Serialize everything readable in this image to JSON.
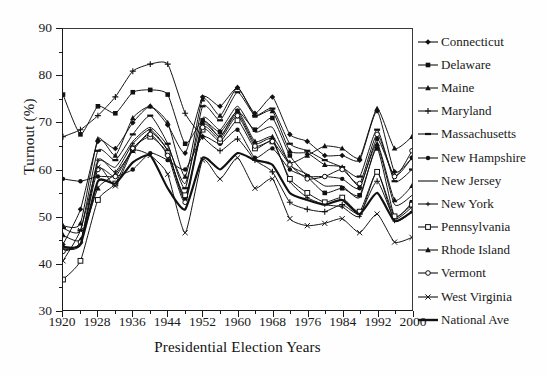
{
  "figure": {
    "background_color": "#fefefe",
    "ink_color": "#1a1a1a"
  },
  "chart_data": {
    "type": "line",
    "title": "",
    "subtitle": "",
    "xlabel": "Presidential Election Years",
    "ylabel": "Turnout (%)",
    "xlim": [
      1920,
      2000
    ],
    "ylim": [
      30,
      90
    ],
    "x": [
      1920,
      1924,
      1928,
      1932,
      1936,
      1940,
      1944,
      1948,
      1952,
      1956,
      1960,
      1964,
      1968,
      1972,
      1976,
      1980,
      1984,
      1988,
      1992,
      1996,
      2000
    ],
    "xticks": [
      1920,
      1928,
      1936,
      1944,
      1952,
      1960,
      1968,
      1976,
      1984,
      1992,
      2000
    ],
    "xtick_labels": [
      "1920",
      "1928",
      "1936",
      "1944",
      "1952",
      "1960",
      "1968",
      "1976",
      "1984",
      "1992",
      "2000"
    ],
    "xminor_ticks": [
      1924,
      1932,
      1940,
      1948,
      1956,
      1964,
      1972,
      1980,
      1988,
      1996
    ],
    "yticks": [
      30,
      40,
      50,
      60,
      70,
      80,
      90
    ],
    "ytick_labels": [
      "30",
      "40",
      "50",
      "60",
      "70",
      "80",
      "90"
    ],
    "yminor_ticks": [
      35,
      45,
      55,
      65,
      75,
      85
    ],
    "grid": false,
    "legend_position": "right",
    "series": [
      {
        "name": "Connecticut",
        "marker": "diamond",
        "line": "solid",
        "width": 1.0,
        "values": [
          44.0,
          51.5,
          66.0,
          64.5,
          70.0,
          73.5,
          69.5,
          63.5,
          75.5,
          73.5,
          77.5,
          72.0,
          75.5,
          67.5,
          66.0,
          63.0,
          63.0,
          62.0,
          72.5,
          59.5,
          62.5
        ]
      },
      {
        "name": "Delaware",
        "marker": "square",
        "line": "solid",
        "width": 1.0,
        "values": [
          76.0,
          67.5,
          73.5,
          72.0,
          76.5,
          77.0,
          76.0,
          65.5,
          70.5,
          68.0,
          72.5,
          68.5,
          71.0,
          63.0,
          58.5,
          55.0,
          56.0,
          54.5,
          64.5,
          50.0,
          53.0
        ]
      },
      {
        "name": "Maine",
        "marker": "triangle",
        "line": "solid",
        "width": 1.0,
        "values": [
          46.0,
          45.0,
          56.0,
          59.0,
          64.0,
          68.0,
          64.0,
          54.0,
          70.0,
          67.0,
          72.5,
          66.0,
          67.0,
          61.5,
          63.0,
          65.0,
          64.5,
          62.5,
          73.0,
          64.5,
          67.0
        ]
      },
      {
        "name": "Maryland",
        "marker": "plus",
        "line": "solid",
        "width": 1.0,
        "values": [
          67.0,
          68.5,
          71.5,
          75.5,
          81.0,
          82.5,
          82.5,
          72.0,
          67.0,
          64.0,
          66.5,
          62.0,
          59.5,
          53.0,
          51.5,
          51.0,
          52.5,
          50.5,
          57.5,
          49.5,
          52.0
        ]
      },
      {
        "name": "Massachusetts",
        "marker": "dash",
        "line": "solid",
        "width": 1.0,
        "values": [
          47.5,
          47.0,
          64.0,
          62.0,
          67.5,
          71.5,
          65.5,
          56.0,
          73.5,
          70.5,
          76.5,
          71.5,
          73.0,
          65.5,
          64.0,
          62.0,
          60.5,
          58.5,
          68.5,
          57.5,
          60.0
        ]
      },
      {
        "name": "New Hampshire",
        "marker": "circle",
        "line": "solid",
        "width": 1.0,
        "values": [
          58.0,
          57.5,
          58.5,
          58.5,
          60.0,
          63.5,
          62.0,
          60.0,
          67.0,
          65.5,
          68.5,
          62.5,
          64.5,
          60.0,
          58.5,
          58.5,
          58.0,
          56.0,
          66.5,
          58.5,
          62.5
        ]
      },
      {
        "name": "New Jersey",
        "marker": "none",
        "line": "solid",
        "width": 1.0,
        "values": [
          43.0,
          44.0,
          61.5,
          60.5,
          66.0,
          69.0,
          65.0,
          57.0,
          71.0,
          68.5,
          73.5,
          68.0,
          69.0,
          61.0,
          59.0,
          56.5,
          56.5,
          54.0,
          65.0,
          52.5,
          54.5
        ]
      },
      {
        "name": "New York",
        "marker": "plus-small",
        "line": "solid",
        "width": 1.0,
        "values": [
          43.0,
          44.5,
          62.0,
          59.5,
          65.5,
          68.5,
          64.0,
          53.5,
          69.5,
          67.0,
          72.0,
          65.5,
          66.5,
          57.5,
          54.0,
          52.5,
          52.0,
          50.0,
          59.5,
          49.0,
          51.0
        ]
      },
      {
        "name": "Pennsylvania",
        "marker": "open-square",
        "line": "solid",
        "width": 1.0,
        "values": [
          36.5,
          40.5,
          53.5,
          57.0,
          64.5,
          67.0,
          63.5,
          54.5,
          68.5,
          66.0,
          70.5,
          64.5,
          66.0,
          58.0,
          55.0,
          53.0,
          54.0,
          51.0,
          59.5,
          50.0,
          52.5
        ]
      },
      {
        "name": "Rhode Island",
        "marker": "triangle",
        "line": "solid",
        "width": 1.0,
        "values": [
          48.0,
          48.5,
          66.5,
          63.0,
          71.0,
          73.5,
          70.0,
          58.5,
          75.0,
          71.5,
          77.5,
          71.5,
          72.5,
          64.0,
          63.5,
          61.0,
          60.5,
          56.5,
          65.5,
          53.5,
          56.5
        ]
      },
      {
        "name": "Vermont",
        "marker": "open-circle",
        "line": "solid",
        "width": 1.0,
        "values": [
          42.5,
          44.5,
          60.0,
          58.5,
          64.5,
          67.5,
          63.0,
          53.0,
          69.0,
          66.5,
          71.5,
          65.0,
          66.0,
          61.0,
          58.0,
          58.5,
          60.0,
          57.0,
          67.5,
          58.5,
          64.0
        ]
      },
      {
        "name": "West Virginia",
        "marker": "x",
        "line": "solid",
        "width": 1.0,
        "values": [
          40.5,
          47.0,
          60.5,
          56.5,
          64.0,
          63.0,
          59.0,
          46.5,
          62.0,
          58.0,
          62.5,
          56.0,
          58.0,
          49.5,
          48.0,
          48.5,
          49.5,
          46.5,
          50.5,
          44.5,
          45.5
        ]
      },
      {
        "name": "National Ave",
        "marker": "none",
        "line": "solid",
        "width": 2.2,
        "values": [
          43.5,
          44.0,
          57.5,
          57.0,
          61.5,
          63.0,
          56.0,
          51.5,
          62.5,
          60.0,
          63.5,
          62.0,
          61.0,
          55.0,
          53.5,
          52.5,
          53.5,
          50.5,
          55.0,
          49.0,
          51.0
        ]
      }
    ]
  },
  "legend": {
    "entries": [
      {
        "label": "Connecticut",
        "marker": "diamond"
      },
      {
        "label": "Delaware",
        "marker": "square"
      },
      {
        "label": "Maine",
        "marker": "triangle"
      },
      {
        "label": "Maryland",
        "marker": "plus"
      },
      {
        "label": "Massachusetts",
        "marker": "dash"
      },
      {
        "label": "New Hampshire",
        "marker": "circle"
      },
      {
        "label": "New Jersey",
        "marker": "none"
      },
      {
        "label": "New York",
        "marker": "plus-small"
      },
      {
        "label": "Pennsylvania",
        "marker": "open-square"
      },
      {
        "label": "Rhode Island",
        "marker": "triangle"
      },
      {
        "label": "Vermont",
        "marker": "open-circle"
      },
      {
        "label": "West Virginia",
        "marker": "x"
      },
      {
        "label": "National Ave",
        "marker": "none"
      }
    ]
  }
}
